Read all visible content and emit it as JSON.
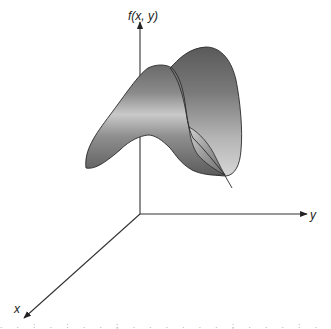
{
  "figure": {
    "axes": {
      "z_label": "f(x, y)",
      "y_label": "y",
      "x_label": "x"
    },
    "colors": {
      "axis": "#333333",
      "surface_dark": "#5a5a5a",
      "surface_mid": "#8c8c8c",
      "surface_light": "#c8c8c8",
      "outline": "#2a2a2a"
    }
  },
  "bottom_strip": {
    "text": ". . : . : . . ; . . . . . . ; . . . : . . . . . ; . ."
  }
}
